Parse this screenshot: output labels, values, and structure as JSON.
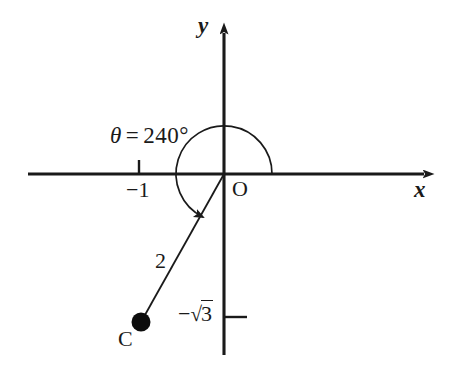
{
  "figure": {
    "type": "coordinate-geometry-diagram",
    "background_color": "#ffffff",
    "stroke_color": "#1a1a1a",
    "axes": {
      "x_axis_label": "x",
      "y_axis_label": "y",
      "origin_label": "O",
      "x_axis_arrow": "right",
      "y_axis_arrow": "up"
    },
    "annotations": {
      "angle_label_symbol": "θ",
      "angle_label_equals": "=",
      "angle_label_value": "240°",
      "angle_label_full": "θ = 240°",
      "x_tick_label": "−1",
      "y_tick_minus": "−",
      "y_tick_radical": "√",
      "y_tick_radicand": "3",
      "y_tick_label_full": "−√3",
      "segment_length_label": "2",
      "point_label": "C"
    },
    "geometry": {
      "origin_x": 224,
      "origin_y": 174,
      "point_c_x": 141,
      "point_c_y": 322,
      "radius": 2,
      "angle_degrees": 240,
      "point_c_coordinates": "(−1, −√3)",
      "arc_radius_px": 48,
      "arc_sweep": "counterclockwise from positive x-axis",
      "x_tick_value": -1,
      "y_tick_value": "-√3"
    }
  }
}
